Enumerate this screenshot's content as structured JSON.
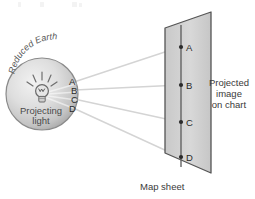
{
  "figure": {
    "width": 255,
    "height": 199
  },
  "globe": {
    "arc_label": "Reduced Earth",
    "source_label_line1": "Projecting",
    "source_label_line2": "light",
    "icon": "light-bulb-icon",
    "edge_points": [
      {
        "id": "A",
        "label": "A"
      },
      {
        "id": "B",
        "label": "B"
      },
      {
        "id": "C",
        "label": "C"
      },
      {
        "id": "D",
        "label": "D"
      }
    ]
  },
  "chart": {
    "sheet_label": "Map sheet",
    "side_label_line1": "Projected",
    "side_label_line2": "image",
    "side_label_line3": "on chart",
    "projected_points": [
      {
        "id": "A",
        "label": "A"
      },
      {
        "id": "B",
        "label": "B"
      },
      {
        "id": "C",
        "label": "C"
      },
      {
        "id": "D",
        "label": "D"
      }
    ]
  },
  "colors": {
    "background": "#ffffff",
    "ink": "#3a3a3a",
    "ray": "#d2d2d2",
    "sheet_fill": "#d2d2d2",
    "sheet_edge": "#555555",
    "globe_edge": "#777777",
    "dot": "#2b2b2b"
  }
}
